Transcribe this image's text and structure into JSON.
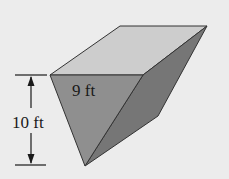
{
  "diagram": {
    "type": "3D solid (triangular-prism-like wedge)",
    "labels": {
      "width": "9 ft",
      "height": "10 ft"
    },
    "colors": {
      "background": "#ececec",
      "top_face": "#cdcdcd",
      "front_face": "#8f8f8f",
      "right_face": "#767676",
      "edge": "#333333",
      "dimension_line": "#1a1a1a"
    }
  }
}
